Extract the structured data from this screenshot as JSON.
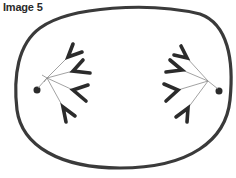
{
  "figure": {
    "label": "Image 5",
    "colors": {
      "outline": "#3a3a3a",
      "chromosome": "#2b2b2b",
      "spindle": "#8a8a8a",
      "background": "#ffffff"
    }
  },
  "poles": [
    {
      "side": "left",
      "chromosome_count": 4
    },
    {
      "side": "right",
      "chromosome_count": 4
    }
  ]
}
